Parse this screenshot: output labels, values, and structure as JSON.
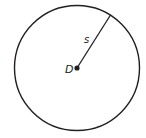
{
  "diagram": {
    "type": "circle-with-radius",
    "center_label": "D",
    "radius_label": "s",
    "stroke_color": "#231f20",
    "background": "#ffffff"
  }
}
